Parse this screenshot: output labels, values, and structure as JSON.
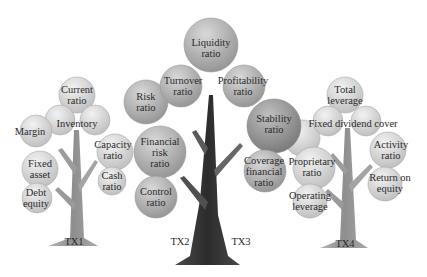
{
  "diagram": {
    "type": "tree-infographic",
    "colors": {
      "leaf_light": "#e4e4e4",
      "leaf_mid": "#b3b3b3",
      "leaf_dark": "#8c8c8c",
      "trunk_light": "#9a9a9a",
      "trunk_dark": "#3a3a3a",
      "text": "#2a2a2a"
    },
    "trees": [
      {
        "id": "TX1",
        "label": "TX1",
        "leaves": [
          {
            "text": "Current ratio"
          },
          {
            "text": "Inventory"
          },
          {
            "text": "Margin"
          },
          {
            "text": "Fixed asset"
          },
          {
            "text": "Debt equity"
          }
        ]
      },
      {
        "id": "TX2",
        "label": "TX2",
        "leaves": [
          {
            "text": "Capacity ratio"
          },
          {
            "text": "Cash ratio"
          },
          {
            "text": "Risk ratio"
          },
          {
            "text": "Financial risk ratio"
          },
          {
            "text": "Control ratio"
          },
          {
            "text": "Turnover ratio"
          },
          {
            "text": "Liquidity ratio"
          }
        ]
      },
      {
        "id": "TX3",
        "label": "TX3",
        "leaves": [
          {
            "text": "Profitability ratio"
          },
          {
            "text": "Stability ratio"
          },
          {
            "text": "Coverage financial ratio"
          }
        ]
      },
      {
        "id": "TX4",
        "label": "TX4",
        "leaves": [
          {
            "text": "Total leverage"
          },
          {
            "text": "Fixed dividend cover"
          },
          {
            "text": "Activity ratio"
          },
          {
            "text": "Proprietary ratio"
          },
          {
            "text": "Return on equity"
          },
          {
            "text": "Operating leverage"
          }
        ]
      }
    ],
    "labels": {
      "current_ratio": [
        "Current",
        "ratio"
      ],
      "inventory": [
        "Inventory"
      ],
      "margin": [
        "Margin"
      ],
      "fixed_asset": [
        "Fixed",
        "asset"
      ],
      "debt_equity": [
        "Debt",
        "equity"
      ],
      "capacity_ratio": [
        "Capacity",
        "ratio"
      ],
      "cash_ratio": [
        "Cash",
        "ratio"
      ],
      "risk_ratio": [
        "Risk",
        "ratio"
      ],
      "financial_risk_ratio": [
        "Financial",
        "risk",
        "ratio"
      ],
      "control_ratio": [
        "Control",
        "ratio"
      ],
      "turnover_ratio": [
        "Turnover",
        "ratio"
      ],
      "liquidity_ratio": [
        "Liquidity",
        "ratio"
      ],
      "profitability_ratio": [
        "Profitability",
        "ratio"
      ],
      "stability_ratio": [
        "Stability",
        "ratio"
      ],
      "coverage_financial_ratio": [
        "Coverage",
        "financial",
        "ratio"
      ],
      "total_leverage": [
        "Total",
        "leverage"
      ],
      "fixed_dividend_cover": [
        "Fixed dividend cover"
      ],
      "activity_ratio": [
        "Activity",
        "ratio"
      ],
      "proprietary_ratio": [
        "Proprietary",
        "ratio"
      ],
      "return_on_equity": [
        "Return on",
        "equity"
      ],
      "operating_leverage": [
        "Operating",
        "leverage"
      ],
      "tx1": "TX1",
      "tx2": "TX2",
      "tx3": "TX3",
      "tx4": "TX4"
    }
  }
}
